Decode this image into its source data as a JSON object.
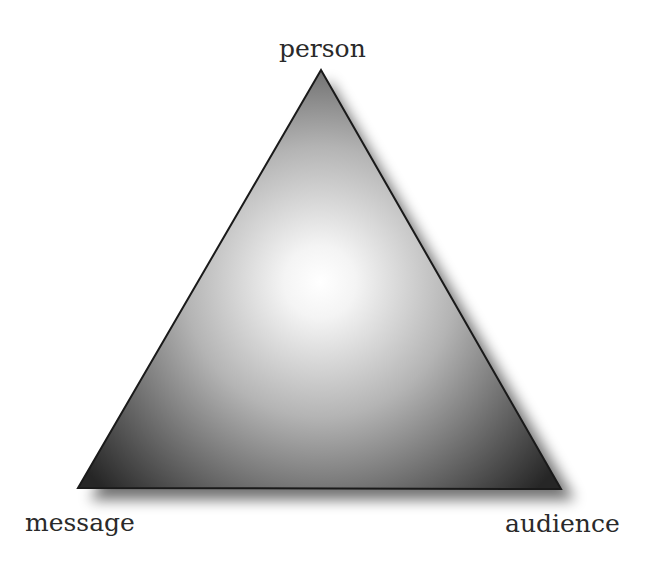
{
  "diagram": {
    "shape": "triangle",
    "vertices": {
      "top": "person",
      "bottom_left": "message",
      "bottom_right": "audience"
    },
    "colors": {
      "center": "#ffffff",
      "corners": "#2b2b2b",
      "outline": "#1a1a1a",
      "text": "#2a2a2a"
    }
  }
}
